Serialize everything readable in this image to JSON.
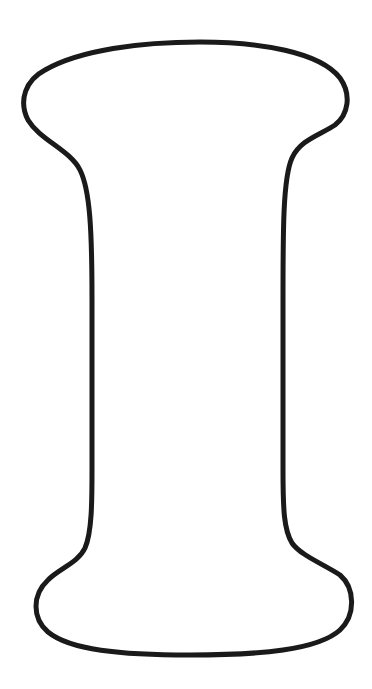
{
  "figure": {
    "subject": "Outline of the letter I",
    "style": "coloring-page outline",
    "stroke_color": "#1a1a1a",
    "fill_color": "#ffffff",
    "background_color": "#ffffff",
    "stroke_width": 5
  }
}
